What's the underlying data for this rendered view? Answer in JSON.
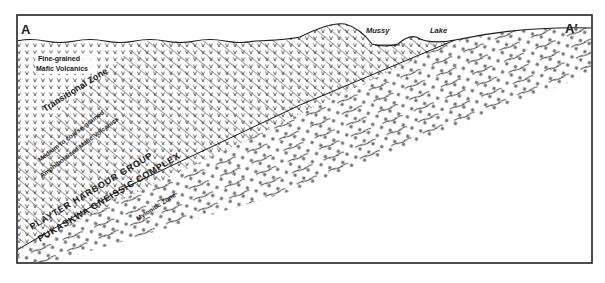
{
  "diagram": {
    "type": "geological-cross-section",
    "section_start_label": "A",
    "section_end_label": "A′",
    "surface_features": {
      "lake_name_part1": "Mussy",
      "lake_name_part2": "Lake"
    },
    "units": [
      {
        "id": "fine-volcanics",
        "line1": "Fine-grained",
        "line2": "Mafic Volcanics",
        "pattern": "v-marks"
      },
      {
        "id": "transitional",
        "label": "Transitional Zone",
        "pattern": "v-marks-with-diagonal-foliation"
      },
      {
        "id": "amphibolitized",
        "line1": "Medium to coarse-grained",
        "line2": "Amphibolitized Mafic Volcanics",
        "pattern": "diagonal-foliation"
      },
      {
        "id": "playter",
        "label": "PLAYTER HARBOUR GROUP"
      },
      {
        "id": "pukaskwa",
        "label": "PUKASKWA GNEISSIC COMPLEX",
        "pattern": "plus-marks-with-shear-lines"
      },
      {
        "id": "mylonitic",
        "label": "Mylonitic Zone",
        "pattern": "plus-marks-with-shear-lines"
      }
    ],
    "colors": {
      "ink": "#1a1a1a",
      "background": "#ffffff",
      "frame": "#222222"
    }
  }
}
